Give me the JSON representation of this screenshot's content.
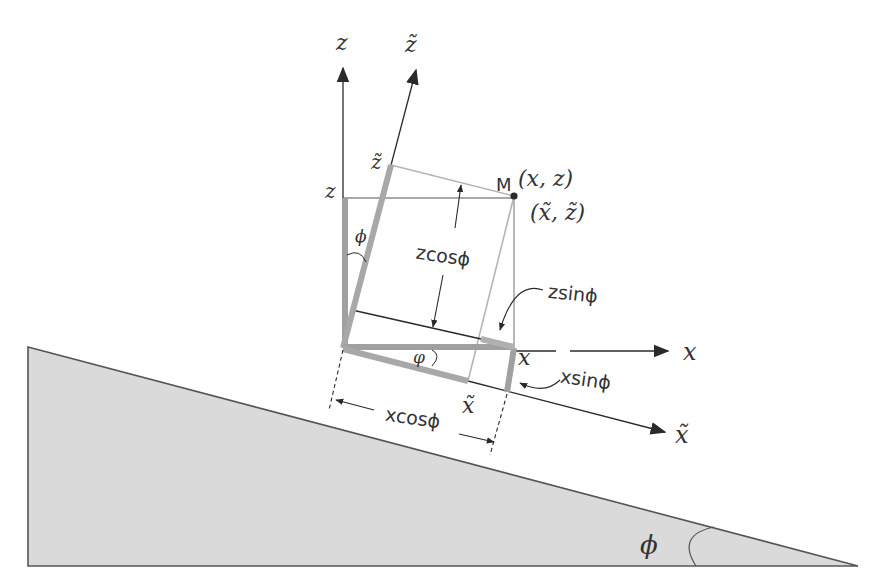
{
  "diagram": {
    "type": "coordinate-rotation-on-incline",
    "colors": {
      "background": "#ffffff",
      "wedge_fill": "#dadada",
      "wedge_stroke": "#555555",
      "axis": "#2a2a2a",
      "thick_gray": "#a0a0a0",
      "thin_gray": "#b5b5b5",
      "text": "#333333"
    },
    "labels": {
      "z_axis": "z",
      "z_tilde_axis": "z̃",
      "x_axis": "x",
      "x_tilde_axis": "x̃",
      "z_point": "z",
      "z_tilde_point": "z̃",
      "x_point": "x",
      "x_tilde_point": "x̃",
      "point_M": "M",
      "M_coords": "(x, z)",
      "M_coords_tilde": "(x̃, z̃)",
      "angle_phi_top": "ϕ",
      "angle_phi_bottom": "φ",
      "angle_phi_wedge": "ϕ",
      "z_cos_phi": "zcosϕ",
      "z_sin_phi": "zsinϕ",
      "x_sin_phi": "xsinϕ",
      "x_cos_phi": "xcosϕ"
    }
  }
}
